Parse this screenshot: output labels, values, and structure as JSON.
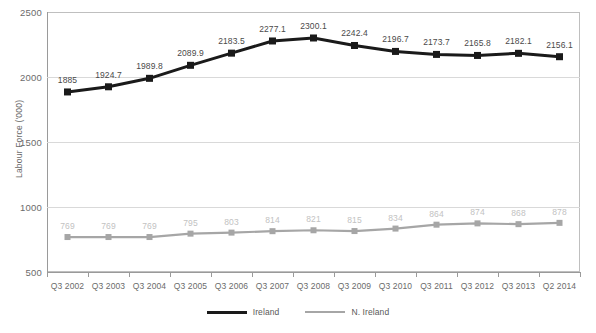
{
  "chart_data": {
    "type": "line",
    "title": "",
    "xlabel": "",
    "ylabel": "Labour Force ('000)",
    "ylim": [
      500,
      2500
    ],
    "yticks": [
      500,
      1000,
      1500,
      2000,
      2500
    ],
    "grid": true,
    "legend_position": "bottom",
    "categories": [
      "Q3 2002",
      "Q3 2003",
      "Q3 2004",
      "Q3 2005",
      "Q3 2006",
      "Q3 2007",
      "Q3 2008",
      "Q3 2009",
      "Q3 2010",
      "Q3 2011",
      "Q3 2012",
      "Q3 2013",
      "Q2 2014"
    ],
    "series": [
      {
        "name": "Ireland",
        "color": "#1a1a1a",
        "marker": "square",
        "values": [
          1885,
          1924.7,
          1989.8,
          2089.9,
          2183.5,
          2277.1,
          2300.1,
          2242.4,
          2196.7,
          2173.7,
          2165.8,
          2182.1,
          2156.1
        ],
        "labels": [
          "1885",
          "1924.7",
          "1989.8",
          "2089.9",
          "2183.5",
          "2277.1",
          "2300.1",
          "2242.4",
          "2196.7",
          "2173.7",
          "2165.8",
          "2182.1",
          "2156.1"
        ]
      },
      {
        "name": "N. Ireland",
        "color": "#a6a6a6",
        "marker": "square",
        "values": [
          769,
          769,
          769,
          795,
          803,
          814,
          821,
          815,
          834,
          864,
          874,
          868,
          878
        ],
        "labels": [
          "769",
          "769",
          "769",
          "795",
          "803",
          "814",
          "821",
          "815",
          "834",
          "864",
          "874",
          "868",
          "878"
        ]
      }
    ]
  },
  "legend": {
    "items": [
      {
        "label": "Ireland",
        "color": "#1a1a1a"
      },
      {
        "label": "N. Ireland",
        "color": "#a6a6a6"
      }
    ]
  }
}
